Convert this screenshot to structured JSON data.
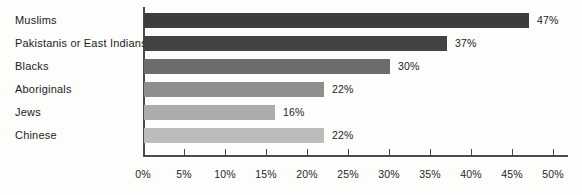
{
  "chart_data": {
    "type": "bar",
    "orientation": "horizontal",
    "categories": [
      "Muslims",
      "Pakistanis or East Indians",
      "Blacks",
      "Aboriginals",
      "Jews",
      "Chinese"
    ],
    "values": [
      47,
      37,
      30,
      22,
      16,
      22
    ],
    "value_labels": [
      "47%",
      "37%",
      "30%",
      "22%",
      "16%",
      "22%"
    ],
    "bar_colors": [
      "#3d3d3d",
      "#434343",
      "#6c6c6c",
      "#8e8e8e",
      "#acacac",
      "#bcbcbc"
    ],
    "xlim": [
      0,
      50
    ],
    "x_ticks": [
      0,
      5,
      10,
      15,
      20,
      25,
      30,
      35,
      40,
      45,
      50
    ],
    "x_tick_labels": [
      "0%",
      "5%",
      "10%",
      "15%",
      "20%",
      "25%",
      "30%",
      "35%",
      "40%",
      "45%",
      "50%"
    ],
    "grid": false,
    "legend": "none",
    "axis_color": "#4a4a4a",
    "background_color": "#fdfdfc"
  }
}
